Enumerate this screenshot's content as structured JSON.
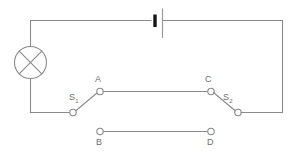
{
  "figure": {
    "background_color": "#ffffff",
    "wire_color": "#8a8a8a",
    "label_color": "#6f6f6f",
    "battery_plate_color": "#151515"
  },
  "components": {
    "lamp": {
      "name": "lamp",
      "symbol": "circle-with-cross"
    },
    "battery": {
      "name": "battery",
      "symbol": "cell-two-plates"
    },
    "switch_1": {
      "name": "switch-s1",
      "label": "S",
      "subscript": "1",
      "state": "open"
    },
    "switch_2": {
      "name": "switch-s2",
      "label": "S",
      "subscript": "2",
      "state": "open"
    }
  },
  "nodes": {
    "a": "A",
    "b": "B",
    "c": "C",
    "d": "D"
  }
}
